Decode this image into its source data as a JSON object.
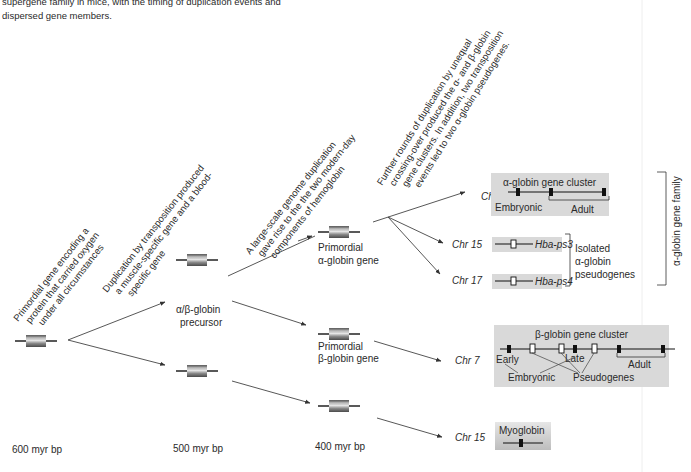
{
  "caption": {
    "line1": "supergene family in mice, with the timing of duplication events and",
    "line2": "dispersed gene members."
  },
  "timeline": {
    "t600": "600 myr bp",
    "t500": "500 myr bp",
    "t400": "400 myr bp"
  },
  "annotations": {
    "a1": [
      "Primordial gene encoding a",
      "protein that carried oxygen",
      "under all circumstances"
    ],
    "a2": [
      "Duplication by transposition produced",
      "a muscle-specific gene and a blood-",
      "specific gene"
    ],
    "a3": [
      "A large-scale genome duplication",
      "gave rise to the the two modern-day",
      "components of hemoglobin"
    ],
    "a4": [
      "Further rounds of duplication by unequal",
      "crossing-over produced the α- and β-globin",
      "gene clusters.  In addition, two transposition",
      "events led to two α-globin pseudogenes."
    ]
  },
  "nodes": {
    "ab_precursor": [
      "α/β-globin",
      "precursor"
    ],
    "alpha_primordial": [
      "Primordial",
      "α-globin gene"
    ],
    "beta_primordial": [
      "Primordial",
      "β-globin gene"
    ]
  },
  "chromosomes": {
    "chr11": "Chr 11",
    "chr15a": "Chr 15",
    "chr17": "Chr 17",
    "chr7": "Chr 7",
    "chr15b": "Chr 15"
  },
  "alpha_cluster": {
    "title": "α-globin gene cluster",
    "embryonic": "Embryonic",
    "adult": "Adult"
  },
  "pseudogenes": {
    "ps3": "Hba-ps3",
    "ps4": "Hba-ps4",
    "group_label": [
      "Isolated",
      "α-globin",
      "pseudogenes"
    ]
  },
  "family_label": "α-globin gene family",
  "beta_cluster": {
    "title": "β-globin gene cluster",
    "early": "Early",
    "late": "Late",
    "adult": "Adult",
    "embryonic": "Embryonic",
    "pseudogenes": "Pseudogenes"
  },
  "myoglobin": {
    "title": "Myoglobin"
  }
}
